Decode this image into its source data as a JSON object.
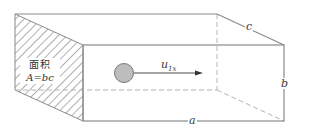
{
  "diagram": {
    "type": "rectangular duct / box perspective with velocity vector",
    "labels": {
      "length": "a",
      "height": "b",
      "depth": "c",
      "area_title": "面积",
      "area_formula": "A=bc",
      "velocity_base": "u",
      "velocity_sub": "1x"
    },
    "colors": {
      "line": "#8a8a8a",
      "dashed": "#b5b5b5",
      "hatch": "#6e6e6e",
      "particle_fill": "#bdbdbd",
      "particle_stroke": "#7a7a7a",
      "arrow": "#4a4a4a"
    }
  }
}
